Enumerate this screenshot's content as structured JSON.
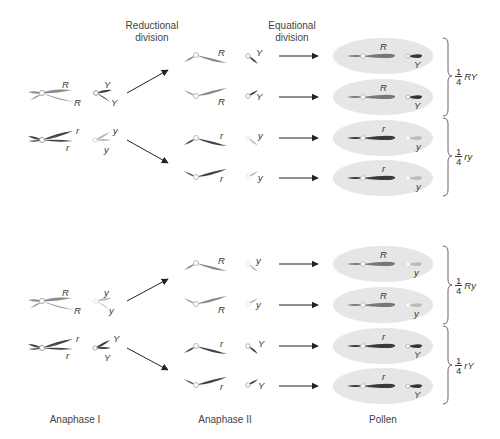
{
  "headers": {
    "reductional": [
      "Reductional",
      "division"
    ],
    "equational": [
      "Equational",
      "division"
    ]
  },
  "stage_labels": {
    "anaphase1": "Anaphase I",
    "anaphase2": "Anaphase II",
    "pollen": "Pollen"
  },
  "colors": {
    "R_chrom": "#8a8a8a",
    "r_chrom": "#444444",
    "Y_chrom": "#3a3a3a",
    "y_chrom": "#b8b8b8",
    "pollen_fill": "#e6e6e6",
    "arrow": "#222222"
  },
  "top_group": {
    "anaphase1": {
      "pair1": {
        "chrom_alleles": [
          "R",
          "R"
        ],
        "small_alleles": [
          "Y",
          "Y"
        ]
      },
      "pair2": {
        "chrom_alleles": [
          "r",
          "r"
        ],
        "small_alleles": [
          "y",
          "y"
        ]
      }
    },
    "anaphase2": [
      {
        "big": "R",
        "small": "Y"
      },
      {
        "big": "R",
        "small": "Y"
      },
      {
        "big": "r",
        "small": "y"
      },
      {
        "big": "r",
        "small": "y"
      }
    ],
    "pollen": [
      {
        "big": "R",
        "small": "Y"
      },
      {
        "big": "R",
        "small": "Y"
      },
      {
        "big": "r",
        "small": "y"
      },
      {
        "big": "r",
        "small": "y"
      }
    ],
    "ratios": [
      {
        "num": "1",
        "den": "4",
        "genotype": "RY"
      },
      {
        "num": "1",
        "den": "4",
        "genotype": "ry"
      }
    ]
  },
  "bottom_group": {
    "anaphase1": {
      "pair1": {
        "chrom_alleles": [
          "R",
          "R"
        ],
        "small_alleles": [
          "y",
          "y"
        ]
      },
      "pair2": {
        "chrom_alleles": [
          "r",
          "r"
        ],
        "small_alleles": [
          "Y",
          "Y"
        ]
      }
    },
    "anaphase2": [
      {
        "big": "R",
        "small": "y"
      },
      {
        "big": "R",
        "small": "y"
      },
      {
        "big": "r",
        "small": "Y"
      },
      {
        "big": "r",
        "small": "Y"
      }
    ],
    "pollen": [
      {
        "big": "R",
        "small": "y"
      },
      {
        "big": "R",
        "small": "y"
      },
      {
        "big": "r",
        "small": "Y"
      },
      {
        "big": "r",
        "small": "Y"
      }
    ],
    "ratios": [
      {
        "num": "1",
        "den": "4",
        "genotype": "Ry"
      },
      {
        "num": "1",
        "den": "4",
        "genotype": "rY"
      }
    ]
  }
}
